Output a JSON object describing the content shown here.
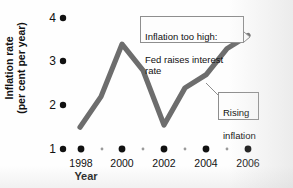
{
  "chart_data": {
    "type": "line",
    "title": "",
    "xlabel": "Year",
    "ylabel": "Inflation rate\n(per cent per year)",
    "ylabel_line1": "Inflation rate",
    "ylabel_line2": "(per cent per year)",
    "x": [
      1998,
      1999,
      2000,
      2001,
      2002,
      2003,
      2004,
      2005,
      2006
    ],
    "values": [
      1.5,
      2.2,
      3.4,
      2.8,
      1.55,
      2.4,
      2.7,
      3.3,
      3.6
    ],
    "series": [
      {
        "name": "Inflation rate",
        "values": [
          1.5,
          2.2,
          3.4,
          2.8,
          1.55,
          2.4,
          2.7,
          3.3,
          3.6
        ]
      }
    ],
    "xlim": [
      1998,
      2006
    ],
    "ylim": [
      1,
      4
    ],
    "xticks": [
      1998,
      1999,
      2000,
      2001,
      2002,
      2003,
      2004,
      2005,
      2006
    ],
    "xtick_labels": [
      "1998",
      "2000",
      "2002",
      "2004",
      "2006"
    ],
    "xtick_label_years": [
      1998,
      2000,
      2002,
      2004,
      2006
    ],
    "yticks": [
      1,
      2,
      3,
      4
    ],
    "ytick_labels": [
      "1",
      "2",
      "3",
      "4"
    ],
    "grid": false,
    "legend": "none",
    "line_color": "#6d6d6d",
    "marker_color": "#111111",
    "annotations": [
      {
        "id": "inflation-too-high",
        "line1": "Inflation too high:",
        "line2": "Fed raises interest rate",
        "text": "Inflation too high:\nFed raises interest rate",
        "points_to_year": 2000,
        "points_to_value": 3.4
      },
      {
        "id": "rising-inflation",
        "line1": "Rising",
        "line2": "inflation",
        "text": "Rising\ninflation",
        "points_to_year": 2004,
        "points_to_value": 2.7
      }
    ]
  },
  "axis": {
    "y_numbers": [
      "4",
      "3",
      "2",
      "1"
    ],
    "x_numbers": [
      "1998",
      "2000",
      "2002",
      "2004",
      "2006"
    ],
    "x_axis_title": "Year"
  }
}
